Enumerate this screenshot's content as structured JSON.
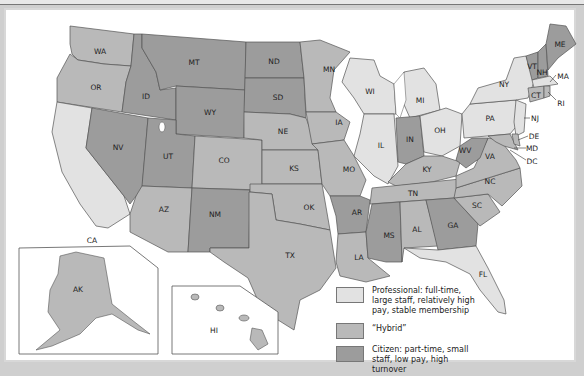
{
  "map": {
    "colors": {
      "professional": "#e2e2e2",
      "hybrid": "#b9b9b9",
      "citizen": "#9c9c9c",
      "border": "#555555",
      "water": "#ffffff"
    },
    "states": {
      "WA": "hybrid",
      "OR": "hybrid",
      "CA": "professional",
      "ID": "citizen",
      "NV": "citizen",
      "MT": "citizen",
      "WY": "citizen",
      "UT": "citizen",
      "CO": "hybrid",
      "AZ": "hybrid",
      "NM": "citizen",
      "ND": "citizen",
      "SD": "citizen",
      "NE": "hybrid",
      "KS": "hybrid",
      "OK": "hybrid",
      "TX": "hybrid",
      "MN": "hybrid",
      "IA": "hybrid",
      "MO": "hybrid",
      "AR": "citizen",
      "LA": "hybrid",
      "WI": "professional",
      "IL": "professional",
      "MI": "professional",
      "IN": "citizen",
      "OH": "professional",
      "KY": "hybrid",
      "TN": "hybrid",
      "MS": "citizen",
      "AL": "hybrid",
      "GA": "citizen",
      "FL": "professional",
      "SC": "hybrid",
      "NC": "hybrid",
      "VA": "hybrid",
      "WV": "citizen",
      "PA": "professional",
      "NY": "professional",
      "NJ": "professional",
      "DE": "hybrid",
      "MD": "hybrid",
      "DC": "hybrid",
      "VT": "citizen",
      "NH": "citizen",
      "ME": "citizen",
      "MA": "professional",
      "CT": "hybrid",
      "RI": "hybrid",
      "AK": "hybrid",
      "HI": "hybrid"
    },
    "labels": {
      "WA": "WA",
      "OR": "OR",
      "CA": "CA",
      "ID": "ID",
      "NV": "NV",
      "MT": "MT",
      "WY": "WY",
      "UT": "UT",
      "CO": "CO",
      "AZ": "AZ",
      "NM": "NM",
      "ND": "ND",
      "SD": "SD",
      "NE": "NE",
      "KS": "KS",
      "OK": "OK",
      "TX": "TX",
      "MN": "MN",
      "IA": "IA",
      "MO": "MO",
      "AR": "AR",
      "LA": "LA",
      "WI": "WI",
      "IL": "IL",
      "MI": "MI",
      "IN": "IN",
      "OH": "OH",
      "KY": "KY",
      "TN": "TN",
      "MS": "MS",
      "AL": "AL",
      "GA": "GA",
      "FL": "FL",
      "SC": "SC",
      "NC": "NC",
      "VA": "VA",
      "WV": "WV",
      "PA": "PA",
      "NY": "NY",
      "NJ": "NJ",
      "DE": "DE",
      "MD": "MD",
      "DC": "DC",
      "VT": "VT",
      "NH": "NH",
      "ME": "ME",
      "MA": "MA",
      "CT": "CT",
      "RI": "RI",
      "AK": "AK",
      "HI": "HI"
    }
  },
  "legend": {
    "items": [
      {
        "key": "professional",
        "label": "Professional: full-time, large staff, relatively high pay, stable membership"
      },
      {
        "key": "hybrid",
        "label": "“Hybrid”"
      },
      {
        "key": "citizen",
        "label": "Citizen: part-time, small staff, low pay, high turnover"
      }
    ]
  }
}
